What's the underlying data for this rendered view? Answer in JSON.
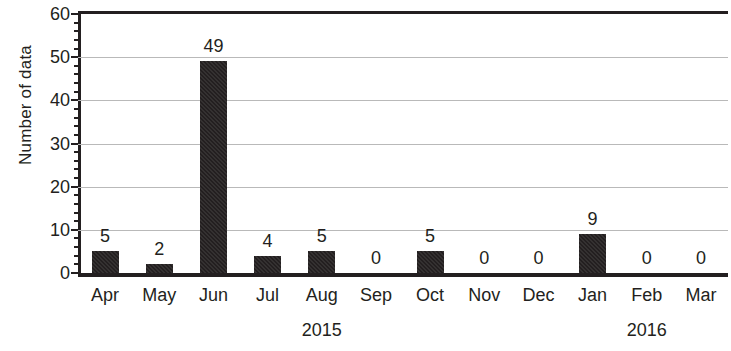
{
  "chart_data": {
    "type": "bar",
    "title": "",
    "xlabel": "",
    "ylabel": "Number of data",
    "categories": [
      "Apr",
      "May",
      "Jun",
      "Jul",
      "Aug",
      "Sep",
      "Oct",
      "Nov",
      "Dec",
      "Jan",
      "Feb",
      "Mar"
    ],
    "values": [
      5,
      2,
      49,
      4,
      5,
      0,
      5,
      0,
      0,
      9,
      0,
      0
    ],
    "data_labels": [
      "5",
      "2",
      "49",
      "4",
      "5",
      "0",
      "5",
      "0",
      "0",
      "9",
      "0",
      "0"
    ],
    "group_labels": [
      {
        "label": "2015",
        "start_category": "Apr",
        "end_category": "Dec"
      },
      {
        "label": "2016",
        "start_category": "Jan",
        "end_category": "Mar"
      }
    ],
    "ylim": [
      0,
      60
    ],
    "ytick_labels": [
      "0",
      "10",
      "20",
      "30",
      "40",
      "50",
      "60"
    ],
    "ytick_values": [
      0,
      10,
      20,
      30,
      40,
      50,
      60
    ],
    "yminor_tick_step": 2,
    "grid": "horizontal",
    "gridline_values": [
      10,
      20,
      30,
      40,
      50
    ],
    "legend": "none",
    "bar_color": "#231f20",
    "gridline_color": "#b9b9b9",
    "axis_color": "#231f20",
    "background_color": "#ffffff"
  }
}
